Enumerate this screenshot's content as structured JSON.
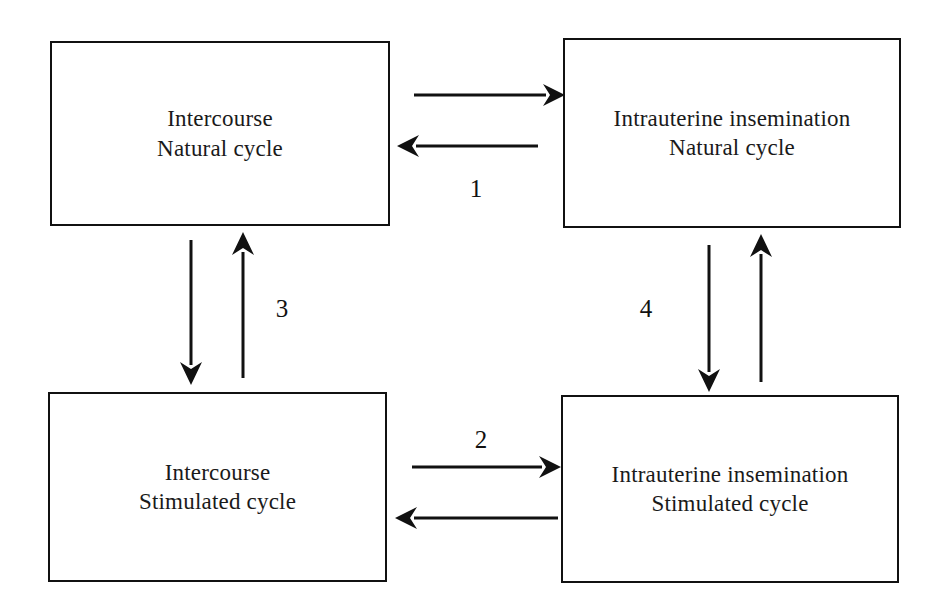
{
  "diagram": {
    "type": "flow-diagram",
    "background_color": "#ffffff",
    "line_color": "#111111",
    "boxes": [
      {
        "id": "intercourse-natural",
        "line1": "Intercourse",
        "line2": "Natural cycle",
        "position": "top-left"
      },
      {
        "id": "iui-natural",
        "line1": "Intrauterine insemination",
        "line2": "Natural cycle",
        "position": "top-right"
      },
      {
        "id": "intercourse-stimulated",
        "line1": "Intercourse",
        "line2": "Stimulated cycle",
        "position": "bottom-left"
      },
      {
        "id": "iui-stimulated",
        "line1": "Intrauterine insemination",
        "line2": "Stimulated cycle",
        "position": "bottom-right"
      }
    ],
    "comparisons": [
      {
        "id": "comparison-1",
        "label": "1",
        "between": "intercourse-natural and iui-natural",
        "orientation": "horizontal",
        "label_position": "below"
      },
      {
        "id": "comparison-2",
        "label": "2",
        "between": "intercourse-stimulated and iui-stimulated",
        "orientation": "horizontal",
        "label_position": "above"
      },
      {
        "id": "comparison-3",
        "label": "3",
        "between": "intercourse-natural and intercourse-stimulated",
        "orientation": "vertical",
        "label_position": "right"
      },
      {
        "id": "comparison-4",
        "label": "4",
        "between": "iui-natural and iui-stimulated",
        "orientation": "vertical",
        "label_position": "left"
      }
    ]
  }
}
